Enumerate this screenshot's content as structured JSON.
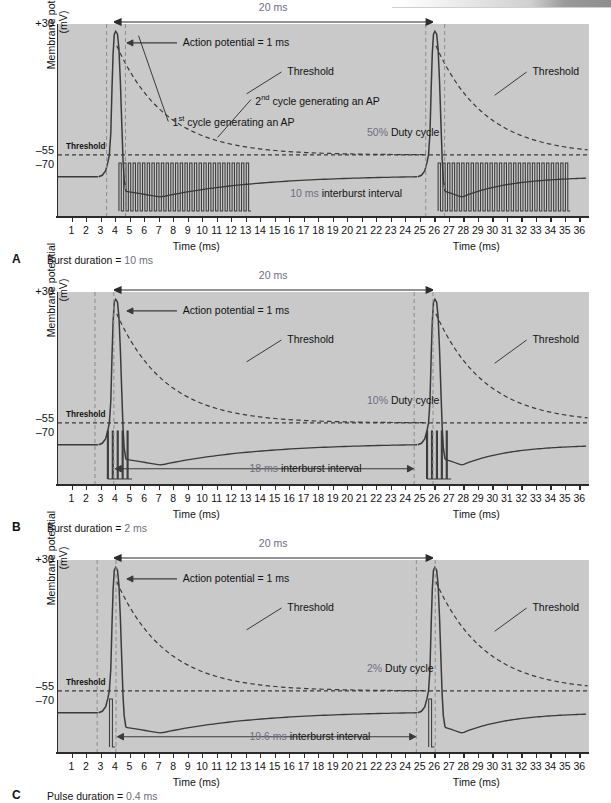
{
  "figure": {
    "axis": {
      "ylabel": "Membrane potential (mV)",
      "yticks": [
        "+30",
        "–55",
        "–70"
      ],
      "ytick_top": "+30",
      "ytick_mid": "–55",
      "ytick_bottom": "–70",
      "xlabel": "Time (ms)",
      "xticks": [
        "1",
        "2",
        "3",
        "4",
        "5",
        "6",
        "7",
        "8",
        "9",
        "10",
        "11",
        "12",
        "13",
        "14",
        "15",
        "16",
        "17",
        "18",
        "19",
        "20",
        "21",
        "22",
        "23",
        "24",
        "25",
        "26",
        "27",
        "28",
        "29",
        "30",
        "31",
        "32",
        "33",
        "34",
        "35",
        "36"
      ],
      "threshold_inplot_label": "Threshold"
    },
    "common": {
      "span_label": "20 ms",
      "ap_label": "Action potential = 1 ms",
      "threshold_label": "Threshold"
    },
    "panels": [
      {
        "letter": "A",
        "caption_prefix": "Burst duration = ",
        "caption_value": "10 ms",
        "duty_value": "50%",
        "duty_suffix": " Duty cycle",
        "interburst_value": "10 ms",
        "interburst_suffix": " interburst interval",
        "extra_annotations": [
          {
            "pre": "1",
            "sup": "st",
            "post": " cycle generating an AP"
          },
          {
            "pre": "2",
            "sup": "nd",
            "post": " cycle generating an AP"
          }
        ],
        "has_interburst_arrow": false,
        "burst_pulses": 28,
        "burst_start_ms": 4.2,
        "burst_end_ms": 13.3,
        "pulse_duty": 0.5
      },
      {
        "letter": "B",
        "caption_prefix": "Burst duration = ",
        "caption_value": "2 ms",
        "duty_value": "10%",
        "duty_suffix": " Duty cycle",
        "interburst_value": "18 ms",
        "interburst_suffix": " interburst interval",
        "extra_annotations": [],
        "has_interburst_arrow": true,
        "burst_pulses": 5,
        "burst_start_ms": 3.4,
        "burst_end_ms": 5.1,
        "pulse_duty": 0.22
      },
      {
        "letter": "C",
        "caption_prefix": "Pulse duration = ",
        "caption_value": "0.4 ms",
        "duty_value": "2%",
        "duty_suffix": " Duty cycle",
        "interburst_value": "19.6 ms",
        "interburst_suffix": " interburst interval",
        "extra_annotations": [],
        "has_interburst_arrow": true,
        "burst_pulses": 1,
        "burst_start_ms": 3.55,
        "burst_end_ms": 3.95,
        "pulse_duty": 0.5
      }
    ],
    "colors": {
      "plot_background": "#c9c9c9",
      "trace": "#3a3a3a",
      "axis": "#2b2b2b",
      "annotation_gray": "#6e6e85",
      "text": "#111111"
    }
  },
  "chart_data": {
    "type": "line",
    "title": "",
    "xlabel": "Time (ms)",
    "ylabel": "Membrane potential (mV)",
    "xlim": [
      0,
      36
    ],
    "ylim": [
      -95,
      35
    ],
    "yticks": [
      30,
      -55,
      -70
    ],
    "xticks": [
      1,
      2,
      3,
      4,
      5,
      6,
      7,
      8,
      9,
      10,
      11,
      12,
      13,
      14,
      15,
      16,
      17,
      18,
      19,
      20,
      21,
      22,
      23,
      24,
      25,
      26,
      27,
      28,
      29,
      30,
      31,
      32,
      33,
      34,
      35,
      36
    ],
    "grid": false,
    "legend": "none",
    "resting_potential_mv": -70,
    "threshold_resting_mv": -55,
    "action_potential_peak_mv": 30,
    "burst_period_ms": 20,
    "panels": [
      {
        "name": "A",
        "duty_cycle_percent": 50,
        "burst_duration_ms": 10,
        "interburst_interval_ms": 10,
        "action_potential_times_ms": [
          3.9,
          25.9
        ],
        "burst_windows_ms": [
          [
            4.2,
            13.3
          ],
          [
            26.2,
            35.3
          ]
        ],
        "pulses_per_burst": 28,
        "annotations": [
          "Action potential = 1 ms",
          "1st cycle generating an AP",
          "Threshold",
          "2nd cycle generating an AP",
          "50% Duty cycle",
          "10 ms interburst interval",
          "20 ms"
        ]
      },
      {
        "name": "B",
        "duty_cycle_percent": 10,
        "burst_duration_ms": 2,
        "interburst_interval_ms": 18,
        "action_potential_times_ms": [
          3.9,
          25.9
        ],
        "burst_windows_ms": [
          [
            3.4,
            5.1
          ],
          [
            25.4,
            27.1
          ]
        ],
        "pulses_per_burst": 5,
        "annotations": [
          "Action potential = 1 ms",
          "Threshold",
          "10% Duty cycle",
          "18 ms interburst interval",
          "20 ms"
        ]
      },
      {
        "name": "C",
        "duty_cycle_percent": 2,
        "pulse_duration_ms": 0.4,
        "interburst_interval_ms": 19.6,
        "action_potential_times_ms": [
          3.9,
          25.9
        ],
        "burst_windows_ms": [
          [
            3.55,
            3.95
          ],
          [
            25.55,
            25.95
          ]
        ],
        "pulses_per_burst": 1,
        "annotations": [
          "Action potential = 1 ms",
          "Threshold",
          "2% Duty cycle",
          "19.6 ms interburst interval",
          "20 ms"
        ]
      }
    ]
  }
}
